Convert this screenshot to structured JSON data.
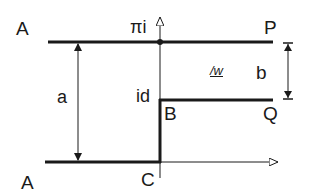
{
  "diagram": {
    "type": "complex-plane-step-channel",
    "colors": {
      "line": "#1a1a1a",
      "background": "#ffffff"
    },
    "labels": {
      "top_left": "A",
      "bottom_left": "A",
      "top_right": "P",
      "step_corner": "B",
      "step_right": "Q",
      "origin": "C",
      "top_axis_point": "πi",
      "step_height_point": "id",
      "dim_a": "a",
      "dim_b": "b",
      "angle_label": "/w"
    },
    "elements": [
      {
        "id": "line-AP",
        "kind": "thick-line",
        "from": [
          48,
          42
        ],
        "to": [
          273,
          42
        ]
      },
      {
        "id": "line-AC",
        "kind": "thick-line",
        "from": [
          45,
          162
        ],
        "to": [
          160,
          162
        ]
      },
      {
        "id": "wall-CB",
        "kind": "thick-line",
        "from": [
          160,
          162
        ],
        "to": [
          160,
          100
        ]
      },
      {
        "id": "line-BQ",
        "kind": "thick-line",
        "from": [
          160,
          100
        ],
        "to": [
          273,
          100
        ]
      },
      {
        "id": "imag-axis",
        "kind": "arrow",
        "from": [
          160,
          178
        ],
        "to": [
          160,
          16
        ]
      },
      {
        "id": "real-axis",
        "kind": "arrow",
        "from": [
          160,
          162
        ],
        "to": [
          278,
          162
        ]
      },
      {
        "id": "dim-a",
        "kind": "double-arrow",
        "from": [
          78,
          42
        ],
        "to": [
          78,
          162
        ]
      },
      {
        "id": "dim-b",
        "kind": "double-arrow",
        "from": [
          288,
          42
        ],
        "to": [
          288,
          100
        ]
      },
      {
        "id": "point-pi-i",
        "kind": "dot",
        "at": [
          160,
          42
        ]
      }
    ]
  }
}
